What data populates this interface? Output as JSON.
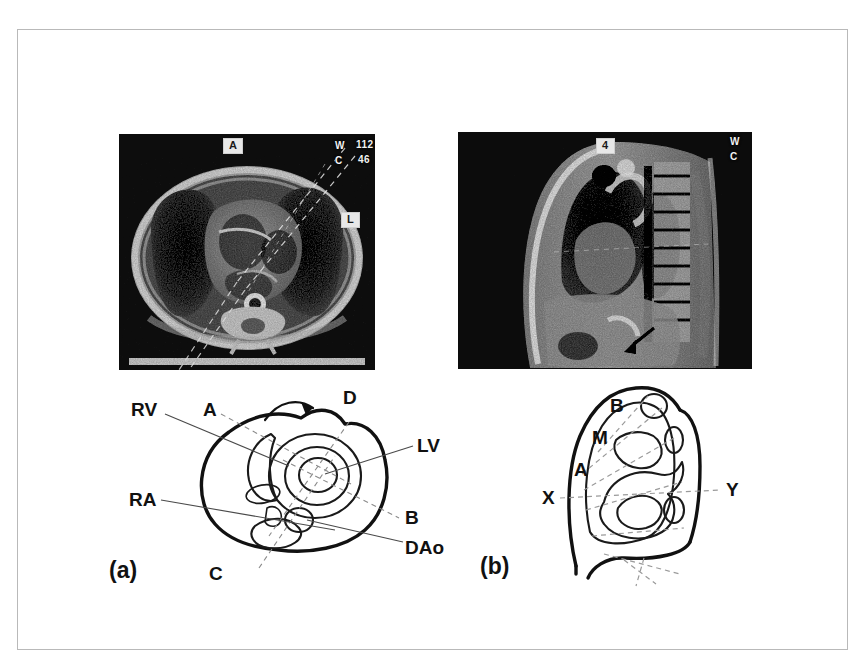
{
  "figure": {
    "caption_panels": [
      "(a)",
      "(b)"
    ]
  },
  "scans": {
    "axial": {
      "name": "axial-chest-mri",
      "overlays": {
        "orientation_anterior": "A",
        "orientation_left": "L",
        "window_label": "W",
        "window_value": "112",
        "center_label": "C",
        "center_value": "46"
      }
    },
    "sagittal": {
      "name": "sagittal-chest-mri",
      "overlays": {
        "slice_box": "4",
        "window_label": "W",
        "center_label": "C"
      }
    }
  },
  "panel_a": {
    "label": "(a)",
    "annotations": {
      "rv": "RV",
      "ra": "RA",
      "lv": "LV",
      "dao": "DAo",
      "plane_a": "A",
      "plane_b": "B",
      "plane_c": "C",
      "plane_d": "D"
    }
  },
  "panel_b": {
    "label": "(b)",
    "annotations": {
      "plane_a": "A",
      "plane_b": "B",
      "plane_m": "M",
      "axis_x": "X",
      "axis_y": "Y"
    }
  },
  "colors": {
    "frame_border": "#b9b9b9",
    "page_background": "#ffffff",
    "ink": "#111111",
    "leader_line": "#4a4a4a",
    "dashed_line": "#9a9a9a"
  }
}
